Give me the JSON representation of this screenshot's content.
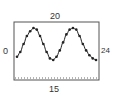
{
  "labels": {
    "top": "20",
    "left": "0",
    "right": "24",
    "bottom": "15"
  },
  "chart_data": {
    "type": "scatter",
    "title": "",
    "xlabel": "15",
    "ylabel": "0",
    "top_label": "20",
    "right_label": "24",
    "x": [
      0,
      1,
      2,
      3,
      4,
      5,
      6,
      7,
      8,
      9,
      10,
      11,
      12,
      13,
      14,
      15,
      16,
      17,
      18,
      19,
      20,
      21,
      22,
      23,
      24
    ],
    "values": [
      0.1,
      0.25,
      0.5,
      0.75,
      0.9,
      1.0,
      0.95,
      0.75,
      0.5,
      0.25,
      0.05,
      0.0,
      0.1,
      0.3,
      0.55,
      0.8,
      0.95,
      1.0,
      0.95,
      0.75,
      0.5,
      0.3,
      0.15,
      0.05,
      0.0
    ],
    "grid": false,
    "legend": null,
    "colors": {
      "line": "#222222",
      "points": "#222222",
      "frame": "#555555",
      "dotted": "#666666"
    }
  }
}
